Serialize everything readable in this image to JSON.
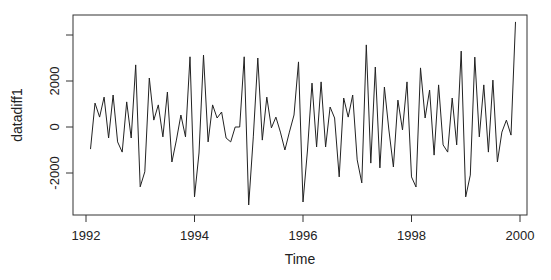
{
  "chart_data": {
    "type": "line",
    "title": "",
    "xlabel": "Time",
    "ylabel": "datadiff1",
    "x_start": 1992.0833,
    "x_step": 0.083333,
    "xlim": [
      1991.87,
      2000.23
    ],
    "ylim": [
      -3800,
      4900
    ],
    "x_ticks": [
      1992,
      1994,
      1996,
      1998,
      2000
    ],
    "x_tick_labels": [
      "1992",
      "1994",
      "1996",
      "1998",
      "2000"
    ],
    "y_ticks": [
      -2000,
      0,
      2000,
      4000
    ],
    "y_tick_labels": [
      "-2000",
      "0",
      "2000",
      ""
    ],
    "grid": false,
    "legend": null,
    "series": [
      {
        "name": "datadiff1",
        "color": "#222222",
        "values": [
          -960,
          1040,
          430,
          1300,
          -480,
          1390,
          -650,
          -1090,
          1090,
          -480,
          2700,
          -2600,
          -1950,
          2130,
          300,
          960,
          -430,
          1520,
          -1520,
          -570,
          520,
          -430,
          3050,
          -3040,
          -1130,
          3130,
          -650,
          960,
          390,
          650,
          -480,
          -650,
          0,
          0,
          3050,
          -3390,
          -430,
          3000,
          -570,
          1300,
          -40,
          430,
          -220,
          -1000,
          -220,
          520,
          2830,
          -3260,
          -1000,
          1910,
          -870,
          1960,
          -870,
          870,
          390,
          -2170,
          1260,
          430,
          1390,
          -1430,
          -2430,
          3570,
          -1570,
          2610,
          -1780,
          1740,
          -130,
          -1740,
          1170,
          -130,
          1960,
          -2170,
          -2610,
          2570,
          390,
          1610,
          -1220,
          1830,
          -780,
          -1090,
          1260,
          -780,
          3300,
          -3040,
          -2090,
          3040,
          -430,
          1830,
          -1090,
          2040,
          -1520,
          -220,
          300,
          -350,
          4570
        ]
      }
    ]
  },
  "axes": {
    "x_title": "Time",
    "y_title": "datadiff1"
  }
}
